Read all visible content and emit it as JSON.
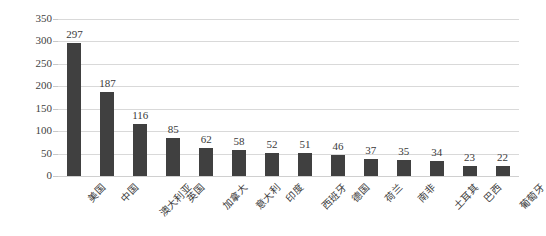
{
  "chart_data": {
    "type": "bar",
    "title": "",
    "subtitle": "",
    "xlabel": "",
    "ylabel": "",
    "ylim": [
      0,
      350
    ],
    "ytick_step": 50,
    "yticks": [
      "0",
      "50",
      "100",
      "150",
      "200",
      "250",
      "300",
      "350"
    ],
    "grid": true,
    "legend": false,
    "legend_position": "none",
    "bar_color": "#404040",
    "gridline_color": "#d9d9d9",
    "background_color": "#ffffff",
    "label_rotation_deg": -45,
    "categories": [
      "美国",
      "中国",
      "澳大利亚",
      "英国",
      "加拿大",
      "意大利",
      "印度",
      "西班牙",
      "德国",
      "荷兰",
      "南非",
      "土耳其",
      "巴西",
      "葡萄牙"
    ],
    "values": [
      297,
      187,
      116,
      85,
      62,
      58,
      52,
      51,
      46,
      37,
      35,
      34,
      23,
      22
    ],
    "value_labels": [
      "297",
      "187",
      "116",
      "85",
      "62",
      "58",
      "52",
      "51",
      "46",
      "37",
      "35",
      "34",
      "23",
      "22"
    ]
  }
}
